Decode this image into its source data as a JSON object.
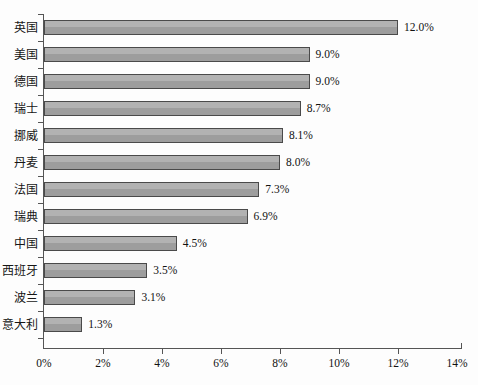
{
  "chart_data": {
    "type": "bar",
    "orientation": "horizontal",
    "title": "",
    "subtitle": "",
    "xlabel": "",
    "ylabel": "",
    "categories": [
      "英国",
      "美国",
      "德国",
      "瑞士",
      "挪威",
      "丹麦",
      "法国",
      "瑞典",
      "中国",
      "西班牙",
      "波兰",
      "意大利"
    ],
    "values": [
      12.0,
      9.0,
      9.0,
      8.7,
      8.1,
      8.0,
      7.3,
      6.9,
      4.5,
      3.5,
      3.1,
      1.3
    ],
    "data_labels": [
      "12.0%",
      "9.0%",
      "9.0%",
      "8.7%",
      "8.1%",
      "8.0%",
      "7.3%",
      "6.9%",
      "4.5%",
      "3.5%",
      "3.1%",
      "1.3%"
    ],
    "xlim": [
      0,
      14
    ],
    "xticks": [
      0,
      2,
      4,
      6,
      8,
      10,
      12,
      14
    ],
    "xtick_labels": [
      "0%",
      "2%",
      "4%",
      "6%",
      "8%",
      "10%",
      "12%",
      "14%"
    ],
    "grid": false,
    "legend": false,
    "legend_position": "none",
    "series": [
      {
        "name": "",
        "values": [
          12.0,
          9.0,
          9.0,
          8.7,
          8.1,
          8.0,
          7.3,
          6.9,
          4.5,
          3.5,
          3.1,
          1.3
        ]
      }
    ],
    "colors": {
      "bar_fill": "#a9a9a9",
      "bar_border": "#4a4a4a",
      "axis": "#555555",
      "text": "#121212",
      "background": "#fdfdfd"
    }
  }
}
